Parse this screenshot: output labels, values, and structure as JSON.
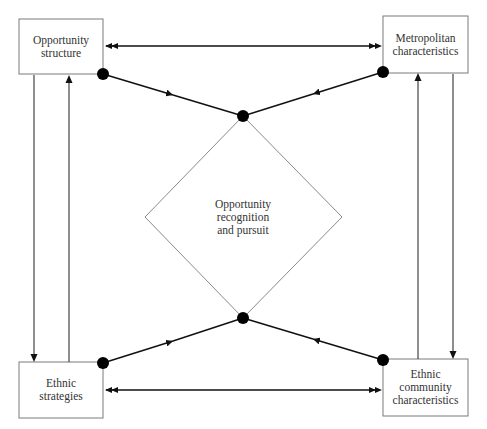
{
  "diagram": {
    "colors": {
      "background": "#ffffff",
      "box_border": "#7a7a7a",
      "connector": "#111111",
      "dot": "#000000",
      "text": "#333333"
    },
    "nodes": {
      "opportunity_structure": {
        "label": "Opportunity\nstructure",
        "position": "top-left"
      },
      "metropolitan_characteristics": {
        "label": "Metropolitan\ncharacteristics",
        "position": "top-right"
      },
      "ethnic_strategies": {
        "label": "Ethnic\nstrategies",
        "position": "bottom-left"
      },
      "ethnic_community_characteristics": {
        "label": "Ethnic\ncommunity\ncharacteristics",
        "position": "bottom-right"
      },
      "opportunity_recognition": {
        "label": "Opportunity\nrecognition\nand pursuit",
        "position": "center",
        "shape": "diamond"
      }
    },
    "edges": [
      {
        "from": "opportunity_structure",
        "to": "metropolitan_characteristics",
        "type": "bidirectional-double-arrow"
      },
      {
        "from": "ethnic_strategies",
        "to": "ethnic_community_characteristics",
        "type": "bidirectional-double-arrow"
      },
      {
        "from": "opportunity_structure",
        "to": "ethnic_strategies",
        "type": "arrow-down"
      },
      {
        "from": "ethnic_strategies",
        "to": "opportunity_structure",
        "type": "arrow-up"
      },
      {
        "from": "ethnic_community_characteristics",
        "to": "metropolitan_characteristics",
        "type": "arrow-up"
      },
      {
        "from": "metropolitan_characteristics",
        "to": "ethnic_community_characteristics",
        "type": "arrow-down"
      },
      {
        "from": "opportunity_structure",
        "to": "opportunity_recognition",
        "type": "dot-to-dot-arrow"
      },
      {
        "from": "metropolitan_characteristics",
        "to": "opportunity_recognition",
        "type": "dot-to-dot-arrow"
      },
      {
        "from": "ethnic_strategies",
        "to": "opportunity_recognition",
        "type": "dot-to-dot-arrow"
      },
      {
        "from": "ethnic_community_characteristics",
        "to": "opportunity_recognition",
        "type": "dot-to-dot-arrow"
      }
    ]
  }
}
